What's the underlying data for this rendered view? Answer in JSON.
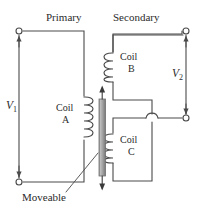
{
  "figure": {
    "type": "circuit-diagram",
    "background_color": "#ffffff",
    "line_color": "#4a4a4a",
    "text_color": "#2b2b2b",
    "core_color": "#9a9a9a"
  },
  "labels": {
    "primary": "Primary",
    "secondary": "Secondary",
    "coil_a_line1": "Coil",
    "coil_a_line2": "A",
    "coil_b_line1": "Coil",
    "coil_b_line2": "B",
    "coil_c_line1": "Coil",
    "coil_c_line2": "C",
    "moveable": "Moveable"
  },
  "voltages": {
    "v1_symbol": "V",
    "v1_sub": "1",
    "v2_symbol": "V",
    "v2_sub": "2"
  },
  "terminals": [
    {
      "name": "primary-top-terminal",
      "x": 19,
      "y": 31
    },
    {
      "name": "primary-bottom-terminal",
      "x": 19,
      "y": 182
    },
    {
      "name": "secondary-top-terminal",
      "x": 186,
      "y": 31
    },
    {
      "name": "secondary-bottom-terminal",
      "x": 186,
      "y": 118
    }
  ],
  "coils": [
    {
      "name": "coil-a",
      "turns": 5,
      "x": 84,
      "y_top": 96,
      "y_bottom": 140
    },
    {
      "name": "coil-b",
      "turns": 4,
      "x": 113,
      "y_top": 52,
      "y_bottom": 82
    },
    {
      "name": "coil-c",
      "turns": 4,
      "x": 113,
      "y_top": 133,
      "y_bottom": 163
    }
  ],
  "core": {
    "name": "moveable-core",
    "x": 99,
    "y_top": 95,
    "y_bottom": 181,
    "width": 6,
    "arrow_up": true,
    "arrow_down": true
  }
}
